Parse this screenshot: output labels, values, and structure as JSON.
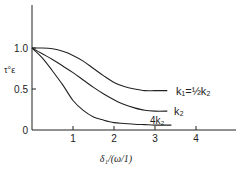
{
  "chart_data": {
    "type": "line",
    "title": "",
    "xlabel": "δ₁/(ω/1)",
    "ylabel": "τ°ε",
    "xlim": [
      0,
      5
    ],
    "ylim": [
      0,
      1.4
    ],
    "x_ticks": [
      "1",
      "2",
      "3",
      "4"
    ],
    "y_ticks": [
      "0",
      "0.5",
      "1.0"
    ],
    "grid": false,
    "legend": "inline labels at curve ends",
    "series": [
      {
        "name": "k1=½k2",
        "x": [
          0,
          0.25,
          0.5,
          0.75,
          1.0,
          1.25,
          1.5,
          1.75,
          2.0,
          2.25,
          2.5,
          2.75,
          3.0,
          3.3
        ],
        "y": [
          1.0,
          1.0,
          0.99,
          0.96,
          0.91,
          0.84,
          0.75,
          0.66,
          0.58,
          0.53,
          0.5,
          0.48,
          0.48,
          0.48
        ]
      },
      {
        "name": "k2",
        "x": [
          0,
          0.25,
          0.5,
          0.75,
          1.0,
          1.25,
          1.5,
          1.75,
          2.0,
          2.25,
          2.5,
          2.75,
          3.0,
          3.3
        ],
        "y": [
          1.0,
          0.93,
          0.86,
          0.78,
          0.7,
          0.61,
          0.52,
          0.44,
          0.37,
          0.31,
          0.27,
          0.24,
          0.23,
          0.23
        ]
      },
      {
        "name": "4k2",
        "x": [
          0,
          0.25,
          0.5,
          0.75,
          1.0,
          1.25,
          1.5,
          1.75,
          2.0,
          2.25,
          2.5,
          2.75,
          3.0,
          3.4
        ],
        "y": [
          1.0,
          0.88,
          0.72,
          0.55,
          0.36,
          0.24,
          0.16,
          0.12,
          0.09,
          0.08,
          0.07,
          0.065,
          0.06,
          0.06
        ]
      }
    ]
  },
  "labels": {
    "y_axis_title": "τ°ε",
    "x_axis_title": "δ₁/(ω/1)",
    "y_tick_0": "0",
    "y_tick_05": "0.5",
    "y_tick_10": "1.0",
    "x_tick_1": "1",
    "x_tick_2": "2",
    "x_tick_3": "3",
    "x_tick_4": "4",
    "curve_top": "k₁=½k₂",
    "curve_mid": "k₂",
    "curve_bottom": "4k₂"
  }
}
